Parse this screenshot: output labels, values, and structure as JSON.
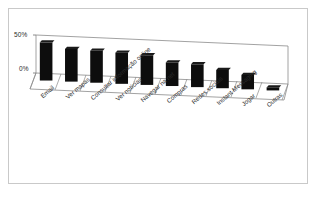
{
  "chart_data": {
    "type": "bar",
    "title": "",
    "subtitle": "",
    "xlabel": "",
    "ylabel": "",
    "ylim": [
      0,
      50
    ],
    "yticks": [
      0,
      50
    ],
    "ytick_labels": [
      "0%",
      "50%"
    ],
    "grid": true,
    "legend": false,
    "legend_position": "none",
    "style": "3d-perspective",
    "bar_color": "#0d0d0d",
    "categories": [
      "Email",
      "Ver mapas",
      "Consultar informação online",
      "Ver notícias",
      "Navegar na net",
      "Compras",
      "Redes sociais",
      "Instant Messaging",
      "Jogar",
      "Outras"
    ],
    "values": [
      50,
      43,
      42,
      41,
      39,
      31,
      30,
      24,
      19,
      4
    ]
  },
  "axes": {
    "y_top_label": "50%",
    "y_bottom_label": "0%"
  },
  "colors": {
    "bar": "#0d0d0d",
    "frame": "#c9c9c9",
    "gridline": "#8a8a8a",
    "floor": "#f4f4f4",
    "text": "#2b2b2b",
    "background": "#ffffff"
  }
}
